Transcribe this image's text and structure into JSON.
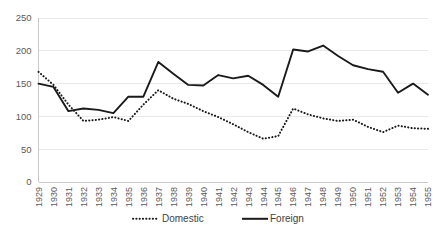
{
  "chart_data": {
    "type": "line",
    "title": "",
    "subtitle": "",
    "xlabel": "",
    "ylabel": "",
    "grid": "horizontal",
    "legend_position": "bottom",
    "ylim": [
      0,
      250
    ],
    "yticks": [
      0,
      50,
      100,
      150,
      200,
      250
    ],
    "ytick_labels": [
      "0",
      "50",
      "100",
      "150",
      "200",
      "250"
    ],
    "categories": [
      "1929",
      "1930",
      "1931",
      "1932",
      "1933",
      "1934",
      "1935",
      "1936",
      "1937",
      "1938",
      "1939",
      "1940",
      "1941",
      "1942",
      "1943",
      "1944",
      "1945",
      "1946",
      "1947",
      "1948",
      "1949",
      "1950",
      "1951",
      "1952",
      "1953",
      "1954",
      "1955"
    ],
    "series": [
      {
        "name": "Domestic",
        "style": "dotted",
        "color": "#1a1a1a",
        "values": [
          168,
          148,
          118,
          93,
          95,
          99,
          93,
          118,
          140,
          127,
          119,
          108,
          99,
          88,
          76,
          66,
          70,
          112,
          103,
          97,
          93,
          95,
          84,
          76,
          86,
          82,
          81
        ]
      },
      {
        "name": "Foreign",
        "style": "solid",
        "color": "#1a1a1a",
        "values": [
          150,
          145,
          108,
          112,
          110,
          105,
          130,
          130,
          183,
          165,
          148,
          147,
          163,
          158,
          162,
          148,
          130,
          202,
          199,
          208,
          192,
          178,
          172,
          168,
          136,
          150,
          133
        ]
      }
    ],
    "legend": [
      {
        "label": "Domestic",
        "style": "dotted"
      },
      {
        "label": "Foreign",
        "style": "solid"
      }
    ]
  }
}
